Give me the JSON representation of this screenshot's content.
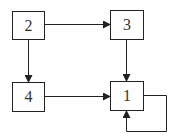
{
  "diagram": {
    "type": "directed-graph",
    "nodes": [
      {
        "id": "2",
        "label": "2",
        "x": 12,
        "y": 11,
        "w": 32,
        "h": 28
      },
      {
        "id": "3",
        "label": "3",
        "x": 110,
        "y": 10,
        "w": 33,
        "h": 29
      },
      {
        "id": "4",
        "label": "4",
        "x": 12,
        "y": 82,
        "w": 32,
        "h": 29
      },
      {
        "id": "1",
        "label": "1",
        "x": 110,
        "y": 81,
        "w": 33,
        "h": 29
      }
    ],
    "edges": [
      {
        "from": "2",
        "to": "3"
      },
      {
        "from": "2",
        "to": "4"
      },
      {
        "from": "3",
        "to": "1"
      },
      {
        "from": "4",
        "to": "1"
      },
      {
        "from": "1",
        "to": "1",
        "self_loop": true
      }
    ],
    "colors": {
      "stroke": "#222222",
      "background": "#ffffff"
    }
  }
}
